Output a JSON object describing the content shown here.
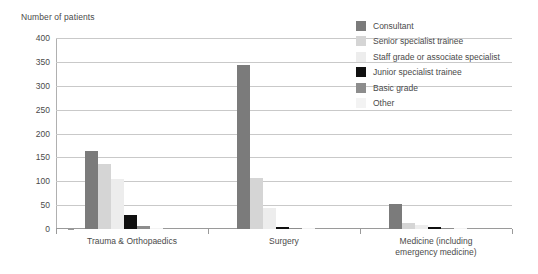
{
  "chart_data": {
    "type": "bar",
    "title": "Number of patients",
    "xlabel": "",
    "ylabel": "Number of patients",
    "ylim": [
      0,
      400
    ],
    "ytick_step": 50,
    "yticks": [
      0,
      50,
      100,
      150,
      200,
      250,
      300,
      350,
      400
    ],
    "grid": true,
    "legend_position": "top-right",
    "categories": [
      "Trauma & Orthopaedics",
      "Surgery",
      "Medicine (including\nemergency medicine)"
    ],
    "series": [
      {
        "name": "Consultant",
        "color": "#7b7b7b",
        "values": [
          163,
          343,
          52
        ]
      },
      {
        "name": "Senior specialist trainee",
        "color": "#d5d5d5",
        "values": [
          137,
          107,
          12
        ]
      },
      {
        "name": "Staff grade or associate specialist",
        "color": "#ededed",
        "values": [
          104,
          45,
          8
        ]
      },
      {
        "name": "Junior specialist trainee",
        "color": "#101010",
        "values": [
          30,
          5,
          4
        ]
      },
      {
        "name": "Basic grade",
        "color": "#8d8d8d",
        "values": [
          6,
          3,
          2
        ]
      },
      {
        "name": "Other",
        "color": "#f3f3f3",
        "values": [
          2,
          1,
          1
        ]
      }
    ]
  },
  "axis": {
    "title": "Number of patients"
  },
  "colors": {
    "gridline": "#c9c9c9",
    "axis": "#9a9a9a",
    "text": "#4a4a4a",
    "background": "#ffffff"
  }
}
